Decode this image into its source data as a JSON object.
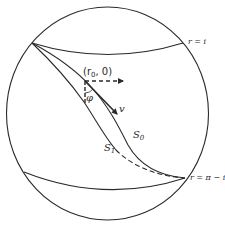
{
  "diagram": {
    "type": "sphere-geodesic-diagram",
    "stroke_color": "#2a2a2a",
    "labels": {
      "top_arc": "r = i",
      "bottom_arc": "r = π − i",
      "point": "(r",
      "point_sub": "0",
      "point_tail": ", 0)",
      "angle": "φ",
      "vector": "v",
      "curve_s0": "S",
      "curve_s0_sub": "0",
      "curve_s1": "S",
      "curve_s1_sub": "1"
    },
    "elements": [
      {
        "kind": "circle",
        "name": "sphere-outline"
      },
      {
        "kind": "arc",
        "name": "r-equals-i-arc",
        "label": "r = i"
      },
      {
        "kind": "arc",
        "name": "r-equals-pi-minus-i-arc",
        "label": "r = π − i"
      },
      {
        "kind": "curve",
        "name": "curve-S0",
        "style": "solid"
      },
      {
        "kind": "curve",
        "name": "curve-S1",
        "style": "solid-then-dashed"
      },
      {
        "kind": "arrow",
        "name": "horizontal-dashed-arrow",
        "style": "dashed"
      },
      {
        "kind": "line",
        "name": "vertical-dashed-line",
        "style": "dashed"
      },
      {
        "kind": "arrow",
        "name": "velocity-arrow-v"
      },
      {
        "kind": "angle",
        "name": "angle-phi"
      }
    ]
  }
}
